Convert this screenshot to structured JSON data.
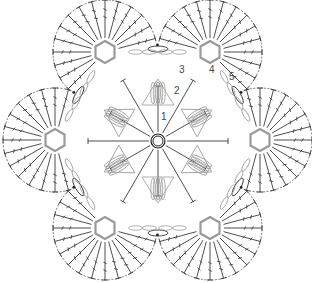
{
  "diagram": {
    "type": "crochet-chart",
    "center": {
      "x": 158,
      "y": 141
    },
    "colors": {
      "dark": "#222222",
      "light": "#9a9a9a",
      "background": "#ffffff"
    },
    "round_labels": [
      {
        "text": "1",
        "x": 161,
        "y": 112
      },
      {
        "text": "2",
        "x": 174,
        "y": 86
      },
      {
        "text": "3",
        "x": 179,
        "y": 65
      },
      {
        "text": "4",
        "x": 209,
        "y": 65
      },
      {
        "text": "5",
        "x": 229,
        "y": 72
      }
    ],
    "fans": [
      {
        "id": "fan-top-left",
        "cx": 105,
        "cy": 52,
        "angle": -120
      },
      {
        "id": "fan-top-right",
        "cx": 210,
        "cy": 52,
        "angle": -60
      },
      {
        "id": "fan-right",
        "cx": 260,
        "cy": 140,
        "angle": 0
      },
      {
        "id": "fan-bottom-right",
        "cx": 210,
        "cy": 228,
        "angle": 60
      },
      {
        "id": "fan-bottom-left",
        "cx": 105,
        "cy": 228,
        "angle": 120
      },
      {
        "id": "fan-left",
        "cx": 55,
        "cy": 140,
        "angle": 180
      }
    ],
    "stitches_per_fan": 15
  }
}
